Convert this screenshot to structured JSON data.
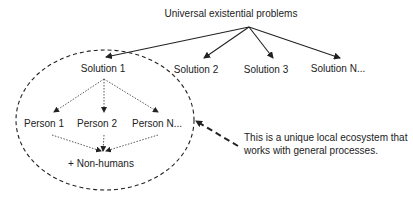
{
  "diagram": {
    "title": "Universal existential problems",
    "solutions": [
      {
        "label": "Solution 1"
      },
      {
        "label": "Solution 2"
      },
      {
        "label": "Solution 3"
      },
      {
        "label": "Solution N..."
      }
    ],
    "persons": [
      {
        "label": "Person 1"
      },
      {
        "label": "Person 2"
      },
      {
        "label": "Person N..."
      }
    ],
    "non_humans": "+ Non-humans",
    "annotation": "This is a unique local ecosystem that works with general processes.",
    "colors": {
      "line": "#222222",
      "text": "#222222",
      "background": "#ffffff"
    }
  }
}
